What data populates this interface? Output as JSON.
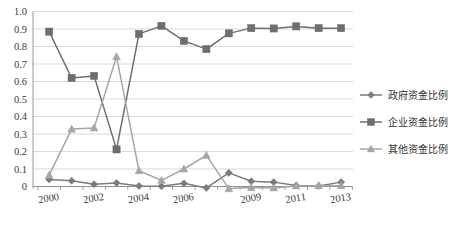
{
  "chart_data": {
    "type": "line",
    "title": "",
    "subtitle": "",
    "xlabel": "",
    "ylabel": "",
    "x": [
      2000,
      2001,
      2002,
      2003,
      2004,
      2005,
      2006,
      2007,
      2008,
      2009,
      2010,
      2011,
      2012,
      2013
    ],
    "categories": [
      "2000",
      "2001",
      "2002",
      "2003",
      "2004",
      "2005",
      "2006",
      "2007",
      "2008",
      "2009",
      "2010",
      "2011",
      "2012",
      "2013"
    ],
    "visible_tick_labels": [
      "2000",
      "",
      "2002",
      "",
      "2004",
      "",
      "2006",
      "",
      "",
      "2009",
      "",
      "2011",
      "",
      "2013"
    ],
    "ytick_labels": [
      "1.0",
      "0.9",
      "0.8",
      "0.7",
      "0.6",
      "0.5",
      "0.4",
      "0.3",
      "0.2",
      "0.1",
      "0"
    ],
    "ytick_values": [
      1.0,
      0.9,
      0.8,
      0.7,
      0.6,
      0.5,
      0.4,
      0.3,
      0.2,
      0.1,
      0
    ],
    "ylim": [
      0,
      1.0
    ],
    "grid": true,
    "legend_position": "right",
    "series": [
      {
        "name": "政府资金比例",
        "marker": "diamond",
        "color": "#7b7b7b",
        "values": [
          0.04,
          0.033,
          0.013,
          0.02,
          0.003,
          0.002,
          0.018,
          -0.008,
          0.078,
          0.03,
          0.025,
          0.006,
          0.003,
          0.025
        ]
      },
      {
        "name": "企业资金比例",
        "marker": "square",
        "color": "#6e6e6e",
        "values": [
          0.885,
          0.62,
          0.632,
          0.212,
          0.872,
          0.918,
          0.832,
          0.785,
          0.875,
          0.905,
          0.903,
          0.915,
          0.905,
          0.905
        ]
      },
      {
        "name": "其他资金比例",
        "marker": "triangle",
        "color": "#a6a6a6",
        "values": [
          0.065,
          0.328,
          0.335,
          0.742,
          0.09,
          0.035,
          0.1,
          0.178,
          -0.012,
          -0.006,
          -0.008,
          0.003,
          0.005,
          0.005
        ]
      }
    ]
  },
  "legend": {
    "items": [
      {
        "label": "政府资金比例"
      },
      {
        "label": "企业资金比例"
      },
      {
        "label": "其他资金比例"
      }
    ]
  }
}
